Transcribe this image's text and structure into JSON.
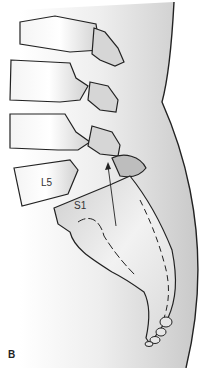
{
  "figure": {
    "panel_label": "B",
    "labels": {
      "l5": "L5",
      "s1": "S1"
    },
    "colors": {
      "outline": "#222222",
      "bone_light": "#f2f2f2",
      "bone_shade": "#c8c8c8",
      "soft_tissue": "#d4d4d4",
      "background": "#ffffff"
    }
  }
}
